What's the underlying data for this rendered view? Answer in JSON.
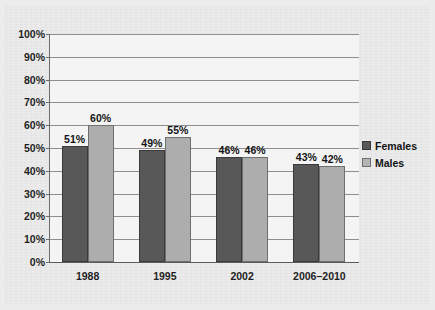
{
  "chart_data": {
    "type": "bar",
    "title": "",
    "xlabel": "",
    "ylabel": "",
    "categories": [
      "1988",
      "1995",
      "2002",
      "2006–2010"
    ],
    "series": [
      {
        "name": "Females",
        "color": "#585858",
        "values": [
          51,
          49,
          46,
          43
        ],
        "labels": [
          "51%",
          "49%",
          "46%",
          "43%"
        ]
      },
      {
        "name": "Males",
        "color": "#adadad",
        "values": [
          60,
          55,
          46,
          42
        ],
        "labels": [
          "60%",
          "55%",
          "46%",
          "42%"
        ]
      }
    ],
    "ylim": [
      0,
      100
    ],
    "ytick_values": [
      100,
      90,
      80,
      70,
      60,
      50,
      40,
      30,
      20,
      10,
      0
    ],
    "ytick_labels": [
      "100%",
      "90%",
      "80%",
      "70%",
      "60%",
      "50%",
      "40%",
      "30%",
      "20%",
      "10%",
      "0%"
    ],
    "grid": true,
    "legend_position": "right"
  },
  "legend": {
    "entries": [
      {
        "label": "Females",
        "swatch": "dark-gray-swatch"
      },
      {
        "label": "Males",
        "swatch": "light-gray-swatch"
      }
    ]
  }
}
